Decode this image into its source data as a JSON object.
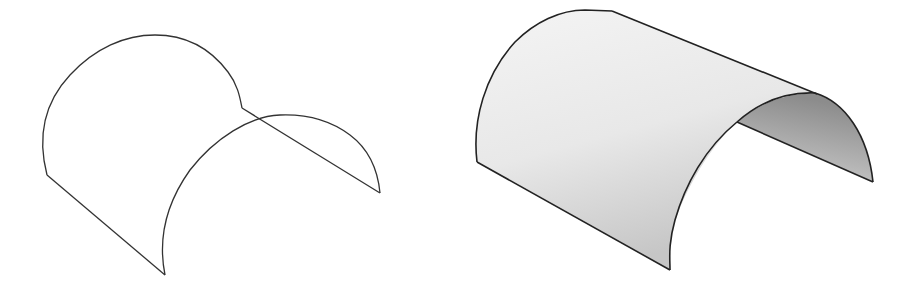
{
  "figures": [
    {
      "id": "wireframe",
      "description": "Half-cylinder surface shown as wireframe edges",
      "stroke_color": "#333333",
      "fill": "none"
    },
    {
      "id": "shaded",
      "description": "Half-cylinder surface shown shaded",
      "stroke_color": "#222222",
      "outer_fill_light": "#f2f2f2",
      "outer_fill_dark": "#c8c8c8",
      "inner_fill_light": "#e6e6e6",
      "inner_fill_dark": "#8f8f8f"
    }
  ]
}
